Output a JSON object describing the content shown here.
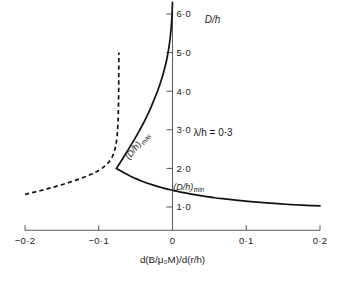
{
  "figure": {
    "background_color": "#ffffff",
    "ink_color": "#111111",
    "axis_color": "#555b5e"
  },
  "chart_data": {
    "type": "line",
    "title": "",
    "subtitle": "",
    "xlabel": "d(B/μ₀M)/d(r/h)",
    "ylabel": "D/h",
    "xlim": [
      -0.2,
      0.2
    ],
    "ylim": [
      0.4,
      6.3
    ],
    "grid": false,
    "legend_position": "inline-annotations",
    "xticks": [
      -0.2,
      -0.1,
      0,
      0.1,
      0.2
    ],
    "xticklabels": [
      "−0·2",
      "−0·1",
      "0",
      "0·1",
      "0·2"
    ],
    "yticks": [
      1.0,
      2.0,
      3.0,
      4.0,
      5.0,
      6.0
    ],
    "yticklabels": [
      "1·0",
      "2·0",
      "3·0",
      "4·0",
      "5·0",
      "6·0"
    ],
    "annotations": [
      {
        "name": "lambda-over-h",
        "text": "λ/h = 0·3",
        "x": 0.055,
        "y": 2.85
      }
    ],
    "series": [
      {
        "name": "(D/h)max",
        "label": "(D/h)",
        "label_sub": "max",
        "style": "solid",
        "label_x": -0.045,
        "label_y": 2.55,
        "label_rotation": -52,
        "points": [
          [
            -0.076,
            2.0
          ],
          [
            -0.07,
            2.18
          ],
          [
            -0.064,
            2.36
          ],
          [
            -0.058,
            2.55
          ],
          [
            -0.052,
            2.74
          ],
          [
            -0.046,
            2.94
          ],
          [
            -0.04,
            3.15
          ],
          [
            -0.0345,
            3.36
          ],
          [
            -0.0295,
            3.57
          ],
          [
            -0.0245,
            3.8
          ],
          [
            -0.02,
            4.02
          ],
          [
            -0.016,
            4.24
          ],
          [
            -0.0125,
            4.46
          ],
          [
            -0.0095,
            4.68
          ],
          [
            -0.007,
            4.9
          ],
          [
            -0.005,
            5.12
          ],
          [
            -0.0034,
            5.34
          ],
          [
            -0.0022,
            5.56
          ],
          [
            -0.0013,
            5.78
          ],
          [
            -0.0006,
            6.0
          ],
          [
            -0.0002,
            6.2
          ],
          [
            0.0,
            6.3
          ]
        ]
      },
      {
        "name": "(D/h)min",
        "label": "(D/h)",
        "label_sub": "min",
        "style": "solid",
        "label_x": 0.022,
        "label_y": 1.45,
        "label_rotation": 0,
        "points": [
          [
            -0.076,
            2.0
          ],
          [
            -0.07,
            1.93
          ],
          [
            -0.064,
            1.865
          ],
          [
            -0.057,
            1.795
          ],
          [
            -0.05,
            1.735
          ],
          [
            -0.043,
            1.68
          ],
          [
            -0.036,
            1.63
          ],
          [
            -0.029,
            1.585
          ],
          [
            -0.0215,
            1.54
          ],
          [
            -0.014,
            1.5
          ],
          [
            -0.007,
            1.465
          ],
          [
            0.0,
            1.435
          ],
          [
            0.008,
            1.4
          ],
          [
            0.017,
            1.365
          ],
          [
            0.026,
            1.335
          ],
          [
            0.036,
            1.3
          ],
          [
            0.046,
            1.27
          ],
          [
            0.057,
            1.24
          ],
          [
            0.068,
            1.215
          ],
          [
            0.08,
            1.19
          ],
          [
            0.093,
            1.165
          ],
          [
            0.106,
            1.14
          ],
          [
            0.119,
            1.118
          ],
          [
            0.133,
            1.098
          ],
          [
            0.147,
            1.08
          ],
          [
            0.161,
            1.063
          ],
          [
            0.175,
            1.048
          ],
          [
            0.188,
            1.037
          ],
          [
            0.2,
            1.028
          ]
        ]
      },
      {
        "name": "(D/h)max-unstable-branch",
        "label": "",
        "label_sub": "",
        "style": "dashed",
        "points": [
          [
            -0.2,
            1.325
          ],
          [
            -0.19,
            1.372
          ],
          [
            -0.18,
            1.42
          ],
          [
            -0.17,
            1.47
          ],
          [
            -0.16,
            1.522
          ],
          [
            -0.15,
            1.578
          ],
          [
            -0.14,
            1.638
          ],
          [
            -0.13,
            1.702
          ],
          [
            -0.12,
            1.772
          ],
          [
            -0.112,
            1.835
          ],
          [
            -0.105,
            1.898
          ],
          [
            -0.099,
            1.96
          ],
          [
            -0.094,
            2.025
          ],
          [
            -0.09,
            2.09
          ],
          [
            -0.0865,
            2.16
          ],
          [
            -0.0835,
            2.24
          ],
          [
            -0.081,
            2.33
          ],
          [
            -0.079,
            2.43
          ],
          [
            -0.0775,
            2.54
          ],
          [
            -0.0762,
            2.67
          ],
          [
            -0.0752,
            2.82
          ],
          [
            -0.0745,
            2.99
          ],
          [
            -0.0739,
            3.19
          ],
          [
            -0.0735,
            3.42
          ],
          [
            -0.0732,
            3.69
          ],
          [
            -0.073,
            3.99
          ],
          [
            -0.0729,
            4.32
          ],
          [
            -0.0728,
            4.68
          ],
          [
            -0.0727,
            5.0
          ]
        ]
      }
    ]
  }
}
